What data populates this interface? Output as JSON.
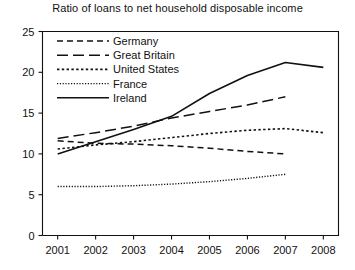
{
  "chart_data": {
    "type": "line",
    "title": "Ratio of loans to net household disposable income",
    "xlabel": "",
    "ylabel": "",
    "x": [
      2001,
      2002,
      2003,
      2004,
      2005,
      2006,
      2007,
      2008
    ],
    "xlim": [
      2000.6,
      2008.4
    ],
    "ylim": [
      0,
      25
    ],
    "yticks": [
      0,
      5,
      10,
      15,
      20,
      25
    ],
    "xticks": [
      2001,
      2002,
      2003,
      2004,
      2005,
      2006,
      2007,
      2008
    ],
    "grid": false,
    "legend_position": "top-left inside",
    "series": [
      {
        "name": "Germany",
        "style": "dashed",
        "x": [
          2001,
          2002,
          2003,
          2004,
          2005,
          2006,
          2007
        ],
        "values": [
          11.6,
          11.3,
          11.2,
          11.0,
          10.7,
          10.3,
          10.0
        ]
      },
      {
        "name": "Great Britain",
        "style": "long-dashed",
        "x": [
          2001,
          2002,
          2003,
          2004,
          2005,
          2006,
          2007
        ],
        "values": [
          11.9,
          12.6,
          13.4,
          14.4,
          15.2,
          16.0,
          17.0
        ]
      },
      {
        "name": "United States",
        "style": "dotted",
        "x": [
          2001,
          2002,
          2003,
          2004,
          2005,
          2006,
          2007,
          2008
        ],
        "values": [
          10.6,
          11.1,
          11.5,
          12.0,
          12.5,
          12.9,
          13.1,
          12.6
        ]
      },
      {
        "name": "France",
        "style": "fine-dotted",
        "x": [
          2001,
          2002,
          2003,
          2004,
          2005,
          2006,
          2007
        ],
        "values": [
          6.0,
          6.0,
          6.1,
          6.3,
          6.6,
          7.0,
          7.5
        ]
      },
      {
        "name": "Ireland",
        "style": "solid",
        "x": [
          2001,
          2002,
          2003,
          2004,
          2005,
          2006,
          2007,
          2008
        ],
        "values": [
          10.0,
          11.5,
          13.0,
          14.6,
          17.4,
          19.6,
          21.2,
          20.6
        ]
      }
    ],
    "legend": [
      {
        "label": "Germany",
        "style": "dashed"
      },
      {
        "label": "Great Britain",
        "style": "long-dashed"
      },
      {
        "label": "United States",
        "style": "dotted"
      },
      {
        "label": "France",
        "style": "fine-dotted"
      },
      {
        "label": "Ireland",
        "style": "solid"
      }
    ],
    "ytick_labels": [
      "0",
      "5",
      "10",
      "15",
      "20",
      "25"
    ],
    "xtick_labels": [
      "2001",
      "2002",
      "2003",
      "2004",
      "2005",
      "2006",
      "2007",
      "2008"
    ],
    "colors": {
      "ink": "#111111",
      "background": "#ffffff"
    }
  }
}
